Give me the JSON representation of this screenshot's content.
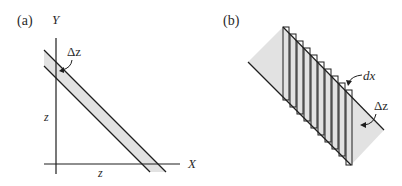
{
  "panels": [
    {
      "id": "a",
      "label": "(a)",
      "axes": {
        "y_label": "Y",
        "x_label": "X"
      },
      "annotations": {
        "band_width": "Δz",
        "y_intercept": "z",
        "x_intercept": "z"
      }
    },
    {
      "id": "b",
      "label": "(b)",
      "strip_count": 10,
      "annotations": {
        "strip_width": "dx",
        "band_width": "Δz"
      }
    }
  ],
  "colors": {
    "band_fill": "#e2e2e2",
    "line": "#1e1e1e",
    "text": "#2a2a2a"
  }
}
